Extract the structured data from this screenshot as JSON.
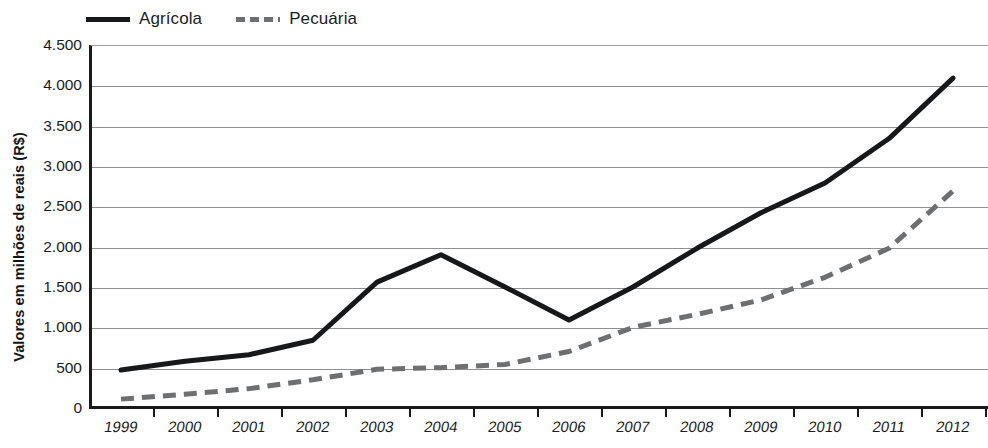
{
  "chart_data": {
    "type": "line",
    "title": "",
    "xlabel": "",
    "ylabel": "Valores em milhões de reais (R$)",
    "categories": [
      "1999",
      "2000",
      "2001",
      "2002",
      "2003",
      "2004",
      "2005",
      "2006",
      "2007",
      "2008",
      "2009",
      "2010",
      "2011",
      "2012"
    ],
    "ylim": [
      0,
      4500
    ],
    "ytick_labels": [
      "0",
      "500",
      "1.000",
      "1.500",
      "2.000",
      "2.500",
      "3.000",
      "3.500",
      "4.000",
      "4.500"
    ],
    "ytick_values": [
      0,
      500,
      1000,
      1500,
      2000,
      2500,
      3000,
      3500,
      4000,
      4500
    ],
    "grid": true,
    "legend_position": "top-left",
    "series": [
      {
        "name": "Agrícola",
        "style": "solid",
        "color": "#17181a",
        "values": [
          470,
          580,
          660,
          840,
          1560,
          1900,
          1500,
          1090,
          1500,
          1980,
          2420,
          2790,
          3340,
          4090
        ]
      },
      {
        "name": "Pecuária",
        "style": "dashed",
        "color": "#6d6f71",
        "values": [
          110,
          170,
          240,
          350,
          480,
          500,
          540,
          700,
          1000,
          1160,
          1340,
          1620,
          1980,
          2690
        ]
      }
    ]
  },
  "legend": {
    "items": [
      {
        "label": "Agrícola",
        "style": "solid"
      },
      {
        "label": "Pecuária",
        "style": "dashed"
      }
    ]
  },
  "axes": {
    "y_title": "Valores em milhões de reais (R$)"
  },
  "colors": {
    "agricola": "#17181a",
    "pecuaria": "#6d6f71",
    "grid": "#8f9092",
    "axis": "#1a1a1a",
    "background": "#ffffff"
  }
}
